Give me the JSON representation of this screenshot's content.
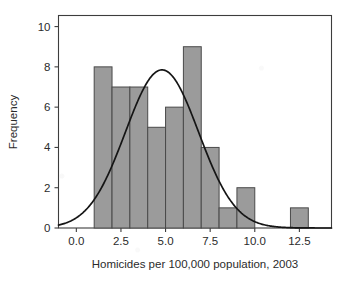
{
  "chart_data": {
    "type": "bar",
    "title": "",
    "xlabel": "Homicides per 100,000 population, 2003",
    "ylabel": "Frequency",
    "xlim": [
      -1.0,
      14.3
    ],
    "ylim": [
      0,
      10.55
    ],
    "grid": false,
    "legend": null,
    "bin_width": 1.0,
    "categories": [
      "1-2",
      "2-3",
      "3-4",
      "4-5",
      "5-6",
      "6-7",
      "7-8",
      "8-9",
      "9-10",
      "10-11",
      "11-12",
      "12-13"
    ],
    "bin_edges": [
      1,
      2,
      3,
      4,
      5,
      6,
      7,
      8,
      9,
      10,
      11,
      12,
      13
    ],
    "values": [
      8,
      7,
      7,
      5,
      6,
      9,
      4,
      1,
      2,
      0,
      0,
      1
    ],
    "xticks": [
      "0.0",
      "2.5",
      "5.0",
      "7.5",
      "10.0",
      "12.5"
    ],
    "xtick_values": [
      0.0,
      2.5,
      5.0,
      7.5,
      10.0,
      12.5
    ],
    "yticks": [
      "0",
      "2",
      "4",
      "6",
      "8",
      "10"
    ],
    "ytick_values": [
      0,
      2,
      4,
      6,
      8,
      10
    ],
    "overlay": {
      "type": "line",
      "name": "normal-density-curve",
      "mean": 4.8,
      "sigma": 2.05,
      "peak_value": 7.85,
      "color": "#151515"
    },
    "colors": {
      "bar_fill": "#9b9b9b",
      "bar_stroke": "#4a4a4a",
      "curve": "#151515",
      "axis": "#3d3d3d",
      "text": "#2b2b2b",
      "background": "#ffffff"
    }
  }
}
